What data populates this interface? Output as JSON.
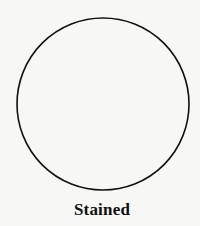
{
  "diagram": {
    "shape": "circle",
    "stroke_color": "#111111",
    "background_color": "#f7f7f5",
    "caption": "Stained"
  }
}
